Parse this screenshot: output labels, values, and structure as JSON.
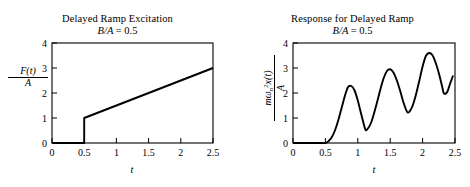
{
  "figure": {
    "background": "#ffffff",
    "ink": "#000000"
  },
  "panels": [
    {
      "id": "delayed-ramp-excitation",
      "title": "Delayed Ramp Excitation",
      "subtitle_prefix": "B/A",
      "subtitle_eq": "=",
      "subtitle_value": "0.5",
      "ylabel_numerator": "F(t)",
      "ylabel_denominator": "A",
      "xlabel": "t"
    },
    {
      "id": "response-for-delayed-ramp",
      "title": "Response for Delayed Ramp",
      "subtitle_prefix": "B/A",
      "subtitle_eq": "=",
      "subtitle_value": "0.5",
      "ylabel_numerator_m": "m",
      "ylabel_numerator_omega": "ω",
      "ylabel_numerator_omega_sub": "n",
      "ylabel_numerator_omega_sup": "2",
      "ylabel_numerator_x": "x(t)",
      "ylabel_denominator": "A",
      "xlabel": "t"
    }
  ],
  "chart_data": [
    {
      "type": "line",
      "title": "Delayed Ramp Excitation",
      "subtitle": "B/A = 0.5",
      "xlabel": "t",
      "ylabel": "F(t)/A",
      "xlim": [
        0,
        2.5
      ],
      "ylim": [
        0,
        4
      ],
      "xticks": [
        0,
        0.5,
        1,
        1.5,
        2,
        2.5
      ],
      "xticklabels": [
        "0",
        "0.5",
        "1",
        "1.5",
        "2",
        "2.5"
      ],
      "yticks": [
        0,
        1,
        2,
        3,
        4
      ],
      "yticklabels": [
        "0",
        "1",
        "2",
        "3",
        "4"
      ],
      "grid": false,
      "legend": null,
      "series": [
        {
          "name": "F(t)/A",
          "description": "Zero until t = 0.5, step jump to 1.0 at t = 0.5, then linear ramp of slope 1 up to 3.0 at t = 2.5",
          "x": [
            0,
            0.5,
            0.5,
            2.5
          ],
          "y": [
            0,
            0,
            1,
            3
          ]
        }
      ]
    },
    {
      "type": "line",
      "title": "Response for Delayed Ramp",
      "subtitle": "B/A = 0.5",
      "xlabel": "t",
      "ylabel": "mωn²x(t)/A",
      "xlim": [
        0,
        2.5
      ],
      "ylim": [
        0,
        4
      ],
      "xticks": [
        0,
        0.5,
        1,
        1.5,
        2,
        2.5
      ],
      "xticklabels": [
        "0",
        "0.5",
        "1",
        "1.5",
        "2",
        "2.5"
      ],
      "yticks": [
        0,
        1,
        2,
        3,
        4
      ],
      "yticklabels": [
        "0",
        "1",
        "2",
        "3",
        "4"
      ],
      "grid": false,
      "legend": null,
      "series": [
        {
          "name": "mωn²x(t)/A",
          "description": "Zero until t = 0.5, then an oscillation about the rising ramp with growing peaks",
          "x": [
            0.0,
            0.1,
            0.2,
            0.3,
            0.4,
            0.5,
            0.55,
            0.6,
            0.65,
            0.7,
            0.75,
            0.8,
            0.85,
            0.9,
            0.95,
            1.0,
            1.05,
            1.1,
            1.12,
            1.15,
            1.2,
            1.25,
            1.3,
            1.35,
            1.4,
            1.45,
            1.5,
            1.55,
            1.6,
            1.65,
            1.7,
            1.75,
            1.77,
            1.8,
            1.85,
            1.9,
            1.95,
            2.0,
            2.05,
            2.1,
            2.15,
            2.2,
            2.25,
            2.3,
            2.33,
            2.38,
            2.42,
            2.47
          ],
          "y": [
            0.0,
            0.0,
            0.0,
            0.0,
            0.0,
            0.0,
            0.08,
            0.24,
            0.52,
            0.92,
            1.4,
            1.88,
            2.24,
            2.28,
            2.1,
            1.7,
            1.18,
            0.68,
            0.52,
            0.56,
            0.78,
            1.18,
            1.66,
            2.16,
            2.6,
            2.88,
            2.95,
            2.82,
            2.52,
            2.12,
            1.66,
            1.3,
            1.22,
            1.26,
            1.52,
            1.96,
            2.5,
            3.06,
            3.48,
            3.6,
            3.52,
            3.22,
            2.8,
            2.28,
            1.98,
            2.04,
            2.34,
            2.7
          ]
        }
      ]
    }
  ]
}
